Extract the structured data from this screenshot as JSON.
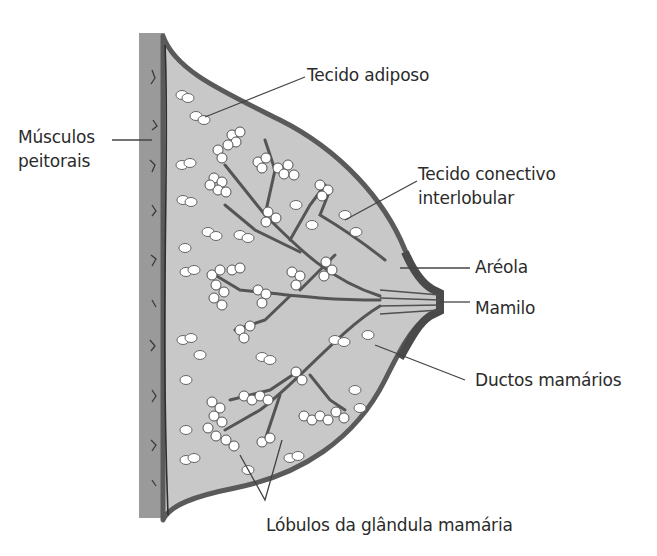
{
  "diagram": {
    "colors": {
      "muscle": "#9a9a9a",
      "tissue_fill": "#c8c8c8",
      "skin_outline": "#5a5a5a",
      "ducts": "#6a6a6a",
      "lobules": "#ffffff",
      "label_text": "#2b2b2b",
      "leader_lines": "#444444"
    },
    "labels": {
      "tecido_adiposo": "Tecido adiposo",
      "musculos_line1": "Músculos",
      "musculos_line2": "peitorais",
      "conectivo_line1": "Tecido conectivo",
      "conectivo_line2": "interlobular",
      "areola": "Aréola",
      "mamilo": "Mamilo",
      "ductos": "Ductos mamários",
      "lobulos": "Lóbulos da glândula mamária"
    }
  }
}
